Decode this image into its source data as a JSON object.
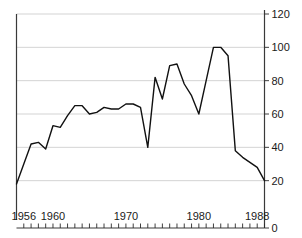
{
  "chart_data": {
    "type": "line",
    "title": "",
    "subtitle": "",
    "xlabel": "",
    "ylabel": "",
    "xlim": [
      1955,
      1989
    ],
    "ylim": [
      0,
      120
    ],
    "grid": true,
    "legend": null,
    "y_axis_position": "right",
    "x_tick_labels": [
      "1956",
      "1960",
      "1970",
      "1980",
      "1988"
    ],
    "x_tick_label_values": [
      1956,
      1960,
      1970,
      1980,
      1988
    ],
    "x_minor_tick_interval": 1,
    "y_tick_labels": [
      "0",
      "20",
      "40",
      "60",
      "80",
      "100",
      "120"
    ],
    "y_tick_values": [
      0,
      20,
      40,
      60,
      80,
      100,
      120
    ],
    "gridline_values": [
      20,
      40,
      60,
      80,
      100,
      120
    ],
    "x": [
      1955,
      1956,
      1957,
      1958,
      1959,
      1960,
      1961,
      1962,
      1963,
      1964,
      1965,
      1966,
      1967,
      1968,
      1969,
      1970,
      1971,
      1972,
      1973,
      1974,
      1975,
      1976,
      1977,
      1978,
      1979,
      1980,
      1981,
      1982,
      1983,
      1984,
      1985,
      1986,
      1987,
      1988,
      1989
    ],
    "values": [
      18,
      30,
      42,
      43,
      39,
      53,
      52,
      59,
      65,
      65,
      60,
      61,
      64,
      63,
      63,
      66,
      66,
      64,
      40,
      82,
      69,
      89,
      90,
      78,
      71,
      60,
      80,
      100,
      100,
      95,
      38,
      34,
      31,
      28,
      20
    ],
    "series": [
      {
        "name": "series-1",
        "color": "#111111",
        "values": [
          18,
          30,
          42,
          43,
          39,
          53,
          52,
          59,
          65,
          65,
          60,
          61,
          64,
          63,
          63,
          66,
          66,
          64,
          40,
          82,
          69,
          89,
          90,
          78,
          71,
          60,
          80,
          100,
          100,
          95,
          38,
          34,
          31,
          28,
          20
        ]
      }
    ],
    "annotations": []
  }
}
